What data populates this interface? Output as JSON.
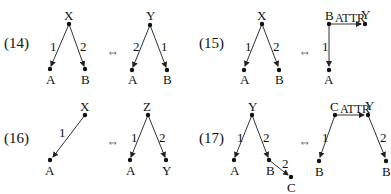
{
  "equivalences": [
    {
      "id": "14",
      "label": "(14)",
      "symbol": "⇔",
      "left": {
        "nodes": {
          "X": "X",
          "A": "A",
          "B": "B"
        },
        "edges": [
          {
            "from": "X",
            "to": "A",
            "label": "1"
          },
          {
            "from": "X",
            "to": "B",
            "label": "2"
          }
        ]
      },
      "right": {
        "nodes": {
          "Y": "Y",
          "A": "A",
          "B": "B"
        },
        "edges": [
          {
            "from": "Y",
            "to": "A",
            "label": "2"
          },
          {
            "from": "Y",
            "to": "B",
            "label": "1"
          }
        ]
      }
    },
    {
      "id": "15",
      "label": "(15)",
      "symbol": "⇔",
      "left": {
        "nodes": {
          "X": "X",
          "A": "A",
          "B": "B"
        },
        "edges": [
          {
            "from": "X",
            "to": "A",
            "label": "1"
          },
          {
            "from": "X",
            "to": "B",
            "label": "2"
          }
        ]
      },
      "right": {
        "nodes": {
          "B": "B",
          "Y": "Y",
          "A": "A"
        },
        "edges": [
          {
            "from": "B",
            "to": "Y",
            "label": "ATTR"
          },
          {
            "from": "B",
            "to": "A",
            "label": "1"
          }
        ]
      }
    },
    {
      "id": "16",
      "label": "(16)",
      "symbol": "⇔",
      "left": {
        "nodes": {
          "X": "X",
          "A": "A"
        },
        "edges": [
          {
            "from": "X",
            "to": "A",
            "label": "1"
          }
        ]
      },
      "right": {
        "nodes": {
          "Z": "Z",
          "A": "A",
          "Y": "Y"
        },
        "edges": [
          {
            "from": "Z",
            "to": "A",
            "label": "1"
          },
          {
            "from": "Z",
            "to": "Y",
            "label": "2"
          }
        ]
      }
    },
    {
      "id": "17",
      "label": "(17)",
      "symbol": "⇔",
      "left": {
        "nodes": {
          "Y": "Y",
          "A": "A",
          "B": "B",
          "C": "C"
        },
        "edges": [
          {
            "from": "Y",
            "to": "A",
            "label": "1"
          },
          {
            "from": "Y",
            "to": "B",
            "label": "2"
          },
          {
            "from": "B",
            "to": "C",
            "label": "2"
          }
        ]
      },
      "right": {
        "nodes": {
          "C": "C",
          "Y": "Y",
          "B1": "B",
          "B2": "B"
        },
        "edges": [
          {
            "from": "C",
            "to": "Y",
            "label": "ATTR"
          },
          {
            "from": "C",
            "to": "B1",
            "label": "1"
          },
          {
            "from": "Y",
            "to": "B2",
            "label": "2"
          }
        ]
      }
    }
  ]
}
